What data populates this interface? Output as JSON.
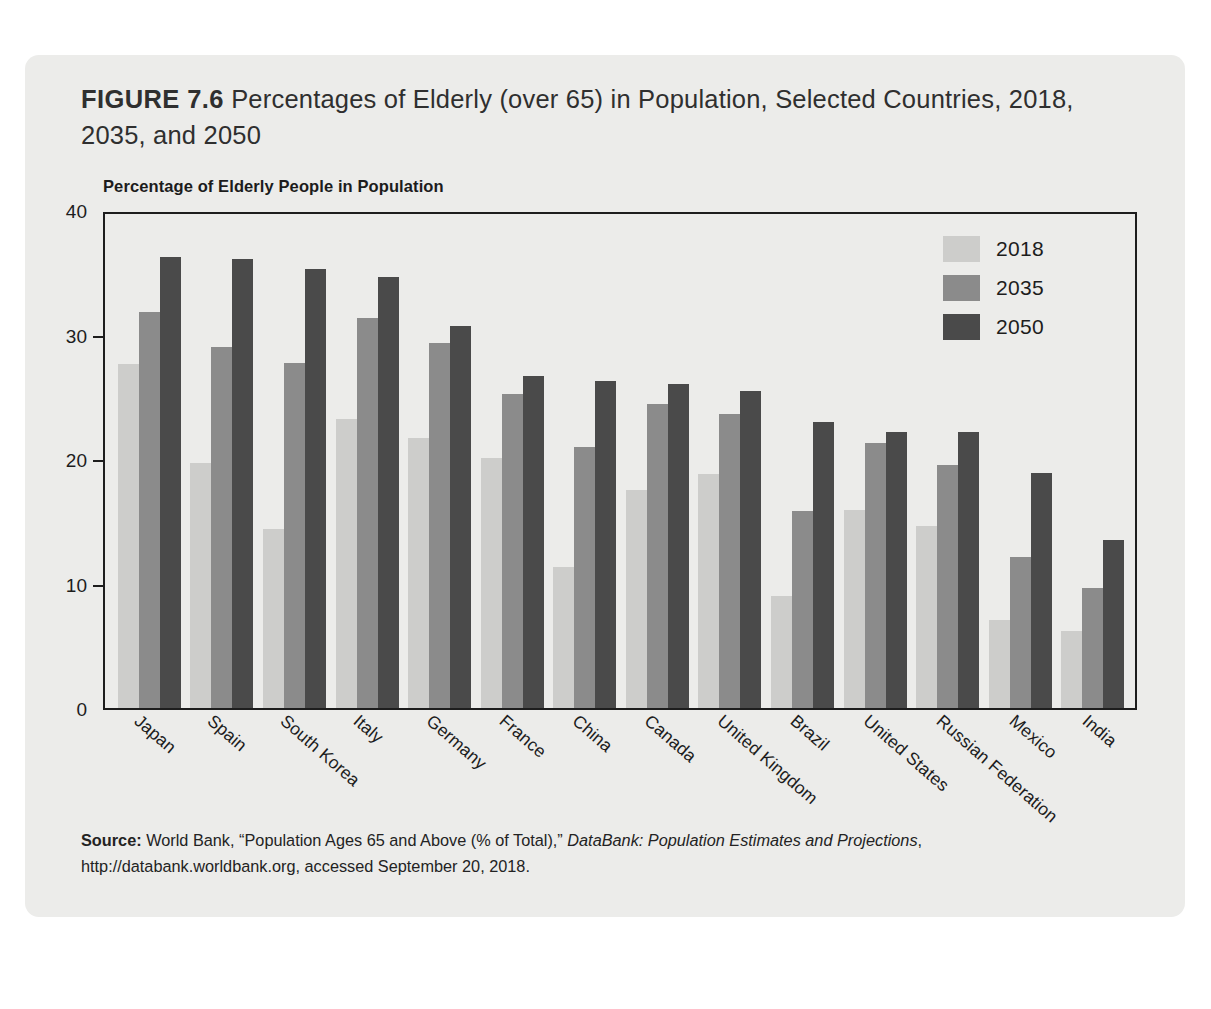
{
  "figure": {
    "label": "FIGURE 7.6",
    "title": " Percentages of Elderly (over 65) in Population, Selected Countries, 2018, 2035, and 2050",
    "axis_caption": "Percentage of Elderly People in Population"
  },
  "legend": {
    "position": "top-right",
    "items": [
      {
        "label": "2018",
        "color": "#cdcdcb"
      },
      {
        "label": "2035",
        "color": "#8b8b8b"
      },
      {
        "label": "2050",
        "color": "#4a4a4a"
      }
    ]
  },
  "y_axis": {
    "ticks": [
      "40",
      "30",
      "20",
      "10",
      "0"
    ]
  },
  "source": {
    "label": "Source:",
    "line1_a": " World Bank, “Population Ages 65 and Above (% of Total),” ",
    "line1_italic": "DataBank: Population Estimates and Projections",
    "line1_b": ",",
    "line2": "http://databank.worldbank.org, accessed September 20, 2018."
  },
  "chart_data": {
    "type": "bar",
    "title": "FIGURE 7.6 Percentages of Elderly (over 65) in Population, Selected Countries, 2018, 2035, and 2050",
    "subtitle": "Percentage of Elderly People in Population",
    "xlabel": "",
    "ylabel": "Percentage of Elderly People in Population",
    "ylim": [
      0,
      40
    ],
    "yticks": [
      0,
      10,
      20,
      30,
      40
    ],
    "grid": false,
    "legend_position": "top-right",
    "categories": [
      "Japan",
      "Spain",
      "South Korea",
      "Italy",
      "Germany",
      "France",
      "China",
      "Canada",
      "United Kingdom",
      "Brazil",
      "United States",
      "Russian Federation",
      "Mexico",
      "India"
    ],
    "series": [
      {
        "name": "2018",
        "color": "#cdcdcb",
        "values": [
          27.6,
          19.7,
          14.4,
          23.2,
          21.7,
          20.1,
          11.3,
          17.5,
          18.8,
          9.0,
          15.9,
          14.6,
          7.1,
          6.2
        ]
      },
      {
        "name": "2035",
        "color": "#8b8b8b",
        "values": [
          31.8,
          29.0,
          27.7,
          31.3,
          29.3,
          25.2,
          21.0,
          24.4,
          23.6,
          15.8,
          21.3,
          19.5,
          12.1,
          9.6
        ]
      },
      {
        "name": "2050",
        "color": "#4a4a4a",
        "values": [
          36.2,
          36.1,
          35.3,
          34.6,
          30.7,
          26.7,
          26.3,
          26.0,
          25.5,
          23.0,
          22.2,
          22.2,
          18.9,
          13.5
        ]
      }
    ]
  }
}
